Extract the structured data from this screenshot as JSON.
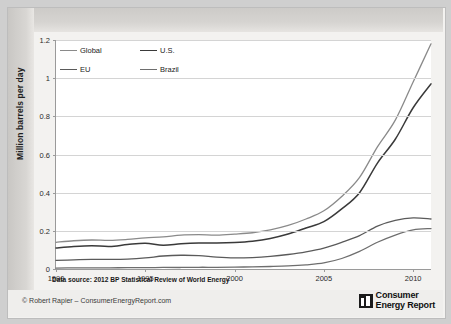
{
  "figure": {
    "ylabel": "Million barrels per day",
    "source_note": "Data source: 2012 BP Statistical Review of World Energy",
    "copyright": "© Robert Rapier – ConsumerEnergyReport.com",
    "logo_line1": "Consumer",
    "logo_line2": "Energy Report",
    "logo_mark_name": "consumer-energy-report-logo-icon"
  },
  "chart_data": {
    "type": "line",
    "title": "",
    "xlabel": "",
    "ylabel": "Million barrels per day",
    "xlim": [
      1990,
      2011
    ],
    "ylim": [
      0,
      1.2
    ],
    "grid": true,
    "legend_position": "top-left",
    "xticks": [
      "1990",
      "1995",
      "2000",
      "2005",
      "2010"
    ],
    "xtick_values": [
      1990,
      1995,
      2000,
      2005,
      2010
    ],
    "yticks": [
      "0",
      "0.2",
      "0.4",
      "0.6",
      "0.8",
      "1",
      "1.2"
    ],
    "ytick_values": [
      0,
      0.2,
      0.4,
      0.6,
      0.8,
      1,
      1.2
    ],
    "x": [
      1990,
      1991,
      1992,
      1993,
      1994,
      1995,
      1996,
      1997,
      1998,
      1999,
      2000,
      2001,
      2002,
      2003,
      2004,
      2005,
      2006,
      2007,
      2008,
      2009,
      2010,
      2011
    ],
    "series": [
      {
        "name": "Global",
        "color": "#8a8a8a",
        "width": 1.3,
        "values": [
          0.14,
          0.148,
          0.152,
          0.15,
          0.155,
          0.163,
          0.168,
          0.178,
          0.18,
          0.178,
          0.183,
          0.19,
          0.205,
          0.228,
          0.262,
          0.305,
          0.38,
          0.48,
          0.64,
          0.78,
          0.98,
          1.18
        ]
      },
      {
        "name": "U.S.",
        "color": "#3a3a3a",
        "width": 1.5,
        "values": [
          0.11,
          0.118,
          0.122,
          0.118,
          0.128,
          0.135,
          0.124,
          0.132,
          0.136,
          0.136,
          0.139,
          0.146,
          0.16,
          0.183,
          0.215,
          0.248,
          0.315,
          0.4,
          0.555,
          0.68,
          0.845,
          0.97
        ]
      },
      {
        "name": "EU",
        "color": "#5a5a5a",
        "width": 1.3,
        "values": [
          0.045,
          0.048,
          0.05,
          0.05,
          0.052,
          0.058,
          0.068,
          0.072,
          0.07,
          0.062,
          0.058,
          0.06,
          0.066,
          0.076,
          0.09,
          0.11,
          0.14,
          0.175,
          0.225,
          0.255,
          0.268,
          0.262
        ]
      },
      {
        "name": "Brazil",
        "color": "#6e6e6e",
        "width": 1.3,
        "values": [
          0.005,
          0.006,
          0.006,
          0.006,
          0.007,
          0.007,
          0.008,
          0.008,
          0.009,
          0.009,
          0.01,
          0.011,
          0.013,
          0.016,
          0.022,
          0.032,
          0.055,
          0.092,
          0.14,
          0.178,
          0.205,
          0.212
        ]
      }
    ]
  }
}
